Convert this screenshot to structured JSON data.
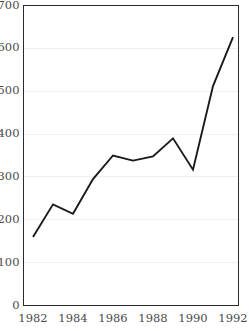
{
  "chart_data": {
    "type": "line",
    "title": "",
    "subtitle": "",
    "xlabel": "",
    "ylabel": "",
    "x": [
      1982,
      1983,
      1984,
      1985,
      1986,
      1987,
      1988,
      1989,
      1990,
      1991,
      1992
    ],
    "values": [
      160,
      236,
      214,
      295,
      350,
      338,
      348,
      390,
      317,
      512,
      626
    ],
    "series": [
      {
        "name": "series-1",
        "values": [
          160,
          236,
          214,
          295,
          350,
          338,
          348,
          390,
          317,
          512,
          626
        ]
      }
    ],
    "xlim": [
      1982,
      1992
    ],
    "ylim": [
      0,
      700
    ],
    "y_ticks": [
      0,
      100,
      200,
      300,
      400,
      500,
      600,
      700
    ],
    "y_tick_labels": [
      "0",
      "100",
      "200",
      "300",
      "400",
      "500",
      "600",
      "700"
    ],
    "x_ticks": [
      1982,
      1984,
      1986,
      1988,
      1990,
      1992
    ],
    "x_tick_labels": [
      "1982",
      "1984",
      "1986",
      "1988",
      "1990",
      "1992"
    ],
    "grid": "horizontal",
    "legend": "none",
    "annotations": [],
    "colors": {
      "line": "#1a1a1a",
      "grid": "#f0f0f0",
      "frame": "#2b2b2b",
      "background": "#ffffff",
      "tick_label": "#4a4a4a"
    }
  }
}
